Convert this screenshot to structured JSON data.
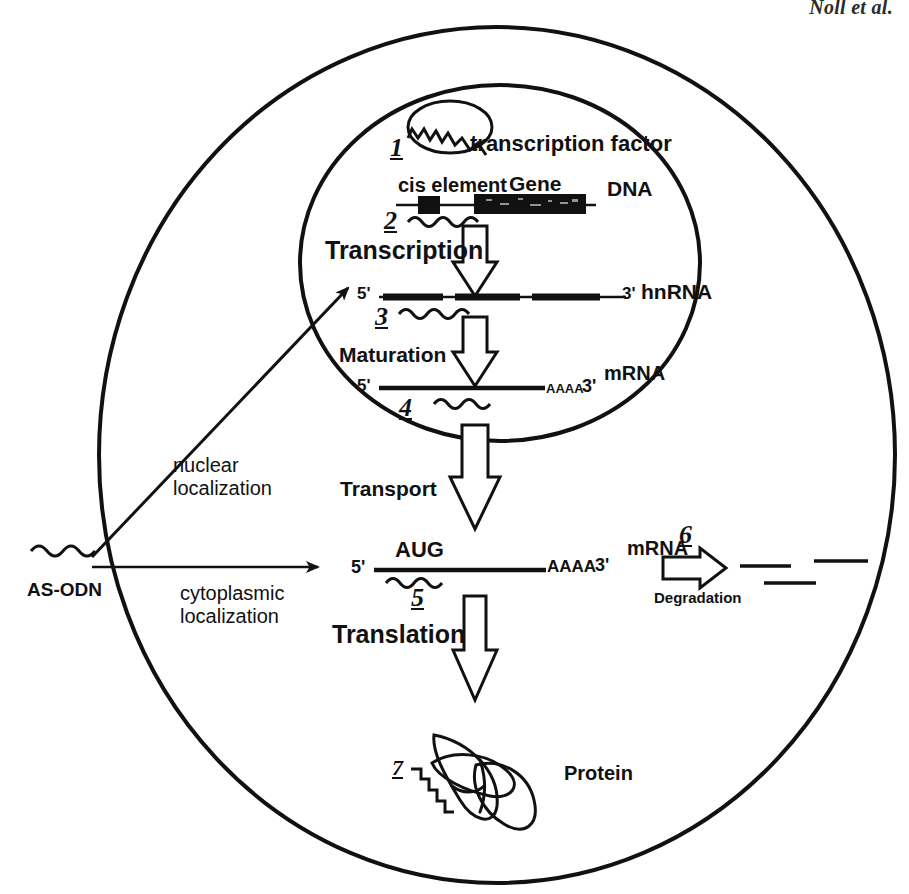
{
  "figure": {
    "running_head": "Noll et al.",
    "caption_title": "Antisense oligodeoxynucleotide (AS-ODN) mechanisms of action in a eukaryotic cell"
  },
  "compartments": {
    "cell_membrane": "cell membrane",
    "nucleus_membrane": "nuclear membrane"
  },
  "entry": {
    "as_odn_label": "AS-ODN",
    "nuclear_route_line1": "nuclear",
    "nuclear_route_line2": "localization",
    "cytoplasmic_route_line1": "cytoplasmic",
    "cytoplasmic_route_line2": "localization"
  },
  "nucleus": {
    "transcription_factor_label": "transcription factor",
    "cis_element_label": "cis element",
    "gene_label": "Gene",
    "dna_label": "DNA",
    "transcription_label": "Transcription",
    "maturation_label": "Maturation",
    "hnrna": {
      "five_prime": "5'",
      "three_prime": "3'",
      "name": "hnRNA"
    },
    "mrna_nuclear": {
      "five_prime": "5'",
      "poly_a": "AAAA",
      "three_prime": "3'",
      "name": "mRNA"
    }
  },
  "transport": {
    "label": "Transport"
  },
  "cytoplasm": {
    "mrna": {
      "five_prime": "5'",
      "start_codon": "AUG",
      "poly_a": "AAAA",
      "three_prime": "3'",
      "name": "mRNA"
    },
    "translation_label": "Translation",
    "degradation_label": "Degradation",
    "protein_label": "Protein"
  },
  "step_numbers": {
    "n1": "1",
    "n2": "2",
    "n3": "3",
    "n4": "4",
    "n5": "5",
    "n6": "6",
    "n7": "7"
  },
  "colors": {
    "ink": "#111111",
    "background": "#ffffff",
    "gene_fill": "#111111"
  }
}
